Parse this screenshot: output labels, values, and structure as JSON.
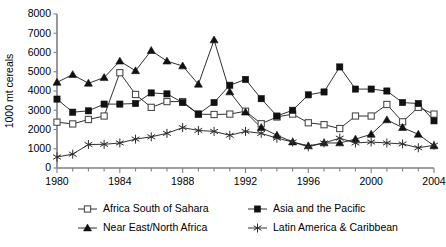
{
  "chart_data": {
    "type": "line",
    "title": "",
    "xlabel": "",
    "ylabel": "1000 mt cereals",
    "xlim": [
      1980,
      2004
    ],
    "ylim": [
      0,
      8000
    ],
    "grid": false,
    "legend_position": "bottom",
    "x": [
      1980,
      1981,
      1982,
      1983,
      1984,
      1985,
      1986,
      1987,
      1988,
      1989,
      1990,
      1991,
      1992,
      1993,
      1994,
      1995,
      1996,
      1997,
      1998,
      1999,
      2000,
      2001,
      2002,
      2003,
      2004
    ],
    "ytick_labels": [
      "0",
      "1000",
      "2000",
      "3000",
      "4000",
      "5000",
      "6000",
      "7000",
      "8000"
    ],
    "ytick_values": [
      0,
      1000,
      2000,
      3000,
      4000,
      5000,
      6000,
      7000,
      8000
    ],
    "xtick_labels": [
      "1980",
      "1984",
      "1988",
      "1992",
      "1996",
      "2000",
      "2004"
    ],
    "xtick_values": [
      1980,
      1984,
      1988,
      1992,
      1996,
      2000,
      2004
    ],
    "series": [
      {
        "name": "Africa South of Sahara",
        "marker": "open-square",
        "values": [
          2380,
          2290,
          2520,
          2700,
          4950,
          3820,
          3150,
          3450,
          3450,
          2800,
          2780,
          2800,
          2950,
          2300,
          2650,
          2800,
          2350,
          2250,
          2050,
          2700,
          2700,
          3300,
          2400,
          3150,
          2800
        ]
      },
      {
        "name": "Asia and the Pacific",
        "marker": "filled-square",
        "values": [
          3580,
          2900,
          2970,
          3320,
          3320,
          3350,
          3900,
          3850,
          3400,
          2800,
          3400,
          4300,
          4600,
          3600,
          2700,
          3000,
          3800,
          3950,
          5250,
          4100,
          4100,
          4000,
          3400,
          3350,
          2450
        ]
      },
      {
        "name": "Near East/North Africa",
        "marker": "filled-triangle",
        "values": [
          4450,
          4850,
          4400,
          4700,
          5550,
          5050,
          6100,
          5550,
          5300,
          4350,
          6650,
          3950,
          2900,
          2100,
          1700,
          1350,
          1150,
          1300,
          1300,
          1500,
          1750,
          2500,
          2100,
          1750,
          1150
        ]
      },
      {
        "name": "Latin America & Caribbean",
        "marker": "star",
        "values": [
          570,
          720,
          1220,
          1230,
          1300,
          1500,
          1620,
          1800,
          2100,
          1950,
          1900,
          1700,
          1900,
          1800,
          1550,
          1350,
          1100,
          1300,
          1550,
          1300,
          1350,
          1300,
          1250,
          1050,
          1180
        ]
      }
    ]
  },
  "legend": {
    "items": [
      {
        "label": "Africa South of Sahara",
        "marker": "open-square"
      },
      {
        "label": "Asia and the Pacific",
        "marker": "filled-square"
      },
      {
        "label": "Near East/North Africa",
        "marker": "filled-triangle"
      },
      {
        "label": "Latin America & Caribbean",
        "marker": "star"
      }
    ]
  }
}
